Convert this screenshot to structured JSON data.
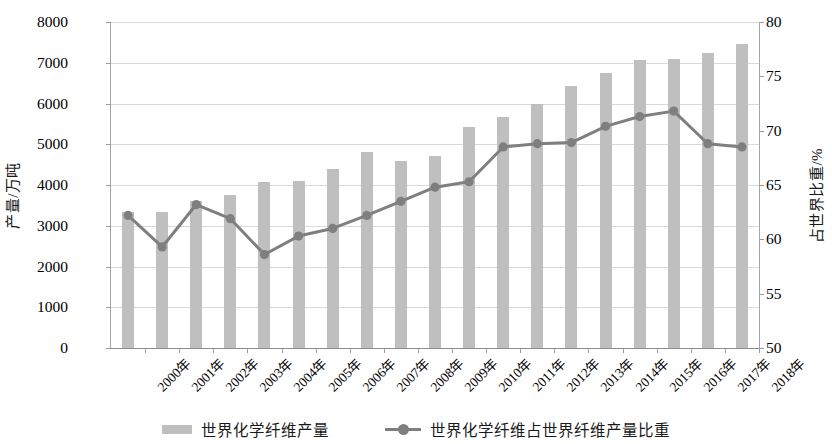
{
  "chart_data": {
    "type": "bar",
    "title": "",
    "subtitle": "",
    "xlabel": "",
    "ylabel": "产量/万吨",
    "y2label": "占世界比重/%",
    "grid": true,
    "legend_position": "bottom",
    "categories": [
      "2000年",
      "2001年",
      "2002年",
      "2003年",
      "2004年",
      "2005年",
      "2006年",
      "2007年",
      "2008年",
      "2009年",
      "2010年",
      "2011年",
      "2012年",
      "2013年",
      "2014年",
      "2015年",
      "2016年",
      "2017年",
      "2018年"
    ],
    "ylim": [
      0,
      8000
    ],
    "yticks": [
      0,
      1000,
      2000,
      3000,
      4000,
      5000,
      6000,
      7000,
      8000
    ],
    "y2lim": [
      50,
      80
    ],
    "y2ticks": [
      50,
      55,
      60,
      65,
      70,
      75,
      80
    ],
    "series": [
      {
        "name": "世界化学纤维产量",
        "kind": "bar",
        "axis": "left",
        "unit": "万吨",
        "color": "#bfbfbf",
        "values": [
          3350,
          3350,
          3620,
          3760,
          4070,
          4100,
          4400,
          4800,
          4590,
          4700,
          5430,
          5680,
          6000,
          6440,
          6750,
          7060,
          7090,
          7250,
          7450
        ]
      },
      {
        "name": "世界化学纤维占世界纤维产量比重",
        "kind": "line",
        "axis": "right",
        "unit": "%",
        "color": "#7f7f7f",
        "values": [
          62.2,
          59.3,
          63.2,
          61.9,
          58.6,
          60.3,
          61.0,
          62.2,
          63.5,
          64.8,
          65.3,
          68.5,
          68.8,
          68.9,
          70.4,
          71.3,
          71.8,
          68.8,
          68.5
        ]
      }
    ]
  },
  "legend": {
    "items": [
      {
        "label": "世界化学纤维产量",
        "marker": "bar-swatch"
      },
      {
        "label": "世界化学纤维占世界纤维产量比重",
        "marker": "line-marker-swatch"
      }
    ]
  },
  "colors": {
    "bar": "#bfbfbf",
    "line": "#7f7f7f",
    "grid": "#d9d9d9",
    "axis": "#a6a6a6",
    "text": "#000000",
    "background": "#ffffff"
  }
}
